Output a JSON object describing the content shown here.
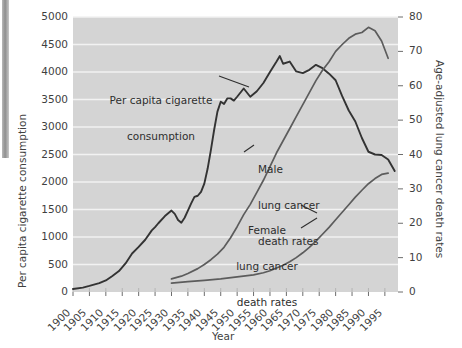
{
  "chart_data": {
    "type": "line",
    "title": "",
    "xlabel": "Year",
    "ylabel": "Per capita cigarette consumption",
    "ylabel_right": "Age-adjusted lung cancer death rates",
    "xlim": [
      1900,
      1999
    ],
    "ylim": [
      0,
      5000
    ],
    "ylim_right": [
      0,
      80
    ],
    "grid": true,
    "legend_position": "inline-annotations",
    "x_ticks": [
      1900,
      1905,
      1910,
      1915,
      1920,
      1925,
      1930,
      1935,
      1940,
      1945,
      1950,
      1955,
      1960,
      1965,
      1970,
      1975,
      1980,
      1985,
      1990,
      1995
    ],
    "y_ticks_left": [
      0,
      500,
      1000,
      1500,
      2000,
      2500,
      3000,
      3500,
      4000,
      4500,
      5000
    ],
    "y_ticks_right": [
      0,
      10,
      20,
      30,
      40,
      50,
      60,
      70,
      80
    ],
    "series": [
      {
        "name": "Per capita cigarette consumption",
        "axis": "left",
        "color": "#333333",
        "annotation": "Per capita cigarette\nconsumption",
        "x": [
          1900,
          1903,
          1905,
          1908,
          1910,
          1912,
          1914,
          1916,
          1918,
          1920,
          1922,
          1924,
          1925,
          1926,
          1928,
          1930,
          1931,
          1932,
          1933,
          1934,
          1935,
          1936,
          1937,
          1938,
          1939,
          1940,
          1941,
          1942,
          1943,
          1944,
          1945,
          1946,
          1947,
          1948,
          1949,
          1950,
          1952,
          1954,
          1956,
          1958,
          1960,
          1962,
          1963,
          1964,
          1966,
          1968,
          1970,
          1972,
          1974,
          1976,
          1978,
          1980,
          1982,
          1984,
          1986,
          1988,
          1990,
          1992,
          1994,
          1996,
          1998
        ],
        "y": [
          54,
          80,
          110,
          160,
          210,
          290,
          380,
          520,
          700,
          820,
          950,
          1120,
          1180,
          1250,
          1380,
          1480,
          1420,
          1310,
          1260,
          1350,
          1480,
          1610,
          1730,
          1750,
          1820,
          1970,
          2240,
          2580,
          2950,
          3280,
          3460,
          3420,
          3520,
          3520,
          3480,
          3550,
          3700,
          3550,
          3650,
          3800,
          4000,
          4190,
          4290,
          4150,
          4190,
          4010,
          3980,
          4040,
          4130,
          4070,
          3970,
          3850,
          3560,
          3300,
          3100,
          2800,
          2550,
          2500,
          2490,
          2410,
          2200
        ],
        "units": "cigarettes per capita per year"
      },
      {
        "name": "Male lung cancer death rates",
        "axis": "right",
        "color": "#5c5c5c",
        "annotation": "Male\nlung cancer\ndeath rates",
        "x": [
          1930,
          1933,
          1935,
          1938,
          1940,
          1942,
          1944,
          1946,
          1948,
          1950,
          1952,
          1954,
          1956,
          1958,
          1960,
          1962,
          1964,
          1966,
          1968,
          1970,
          1972,
          1974,
          1976,
          1978,
          1980,
          1982,
          1984,
          1986,
          1988,
          1990,
          1992,
          1994,
          1996
        ],
        "y": [
          3.8,
          4.6,
          5.4,
          6.8,
          8.0,
          9.4,
          11.0,
          13.0,
          15.8,
          19.0,
          22.5,
          25.5,
          29.0,
          32.5,
          36.5,
          40.5,
          44.0,
          47.5,
          51.0,
          54.5,
          58.0,
          61.5,
          64.5,
          67.0,
          70.0,
          72.0,
          73.8,
          75.0,
          75.5,
          77.0,
          76.0,
          73.0,
          68.0
        ],
        "units": "deaths per 100,000"
      },
      {
        "name": "Female lung cancer death rates",
        "axis": "right",
        "color": "#5c5c5c",
        "annotation": "Female\nlung cancer\ndeath rates",
        "x": [
          1930,
          1935,
          1940,
          1945,
          1950,
          1955,
          1958,
          1960,
          1962,
          1964,
          1966,
          1968,
          1970,
          1972,
          1974,
          1976,
          1978,
          1980,
          1982,
          1984,
          1986,
          1988,
          1990,
          1992,
          1994,
          1996
        ],
        "y": [
          2.6,
          3.0,
          3.4,
          3.8,
          4.4,
          5.0,
          5.6,
          6.2,
          7.0,
          7.8,
          8.8,
          10.0,
          11.4,
          13.0,
          14.8,
          16.8,
          18.8,
          21.0,
          23.2,
          25.4,
          27.6,
          29.6,
          31.5,
          33.0,
          34.2,
          34.6
        ],
        "units": "deaths per 100,000"
      }
    ]
  },
  "axes": {
    "left_title": "Per capita cigarette consumption",
    "right_title": "Age-adjusted lung cancer death rates",
    "x_title": "Year"
  },
  "annotations": {
    "cigarette": {
      "line1": "Per capita cigarette",
      "line2": "consumption"
    },
    "male": {
      "line1": "Male",
      "line2": "lung cancer",
      "line3": "death rates"
    },
    "female": {
      "line1": "Female",
      "line2": "lung cancer",
      "line3": "death rates"
    }
  },
  "colors": {
    "plot_background": "#d4d4d4",
    "gridline": "#f2f2f2",
    "cigarette_line": "#333333",
    "death_rate_line": "#5c5c5c",
    "text": "#3f3f3f"
  }
}
